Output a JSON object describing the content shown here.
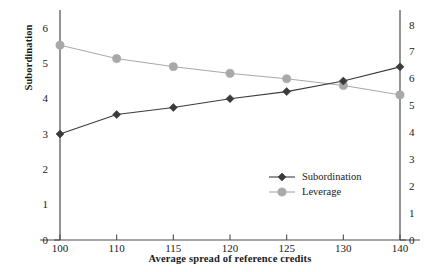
{
  "chart_data": {
    "type": "line",
    "title": "",
    "subtitle": "",
    "xlabel": "Average spread of reference credits",
    "ylabel": "Subordination",
    "y2label": "",
    "categories": [
      "100",
      "110",
      "115",
      "120",
      "125",
      "130",
      "140"
    ],
    "x_tick_labels": [
      "100",
      "110",
      "115",
      "120",
      "125",
      "130",
      "140"
    ],
    "y_tick_labels": [
      "0",
      "1",
      "2",
      "3",
      "4",
      "5",
      "6"
    ],
    "y2_tick_labels": [
      "0",
      "1",
      "2",
      "3",
      "4",
      "5",
      "6",
      "7",
      "8"
    ],
    "ylim": [
      0,
      6
    ],
    "y2lim": [
      0,
      8
    ],
    "grid": false,
    "legend_position": "center-right",
    "series": [
      {
        "name": "Subordination",
        "axis": "left",
        "marker": "diamond",
        "color": "#3b3b3b",
        "values": [
          3.0,
          3.55,
          3.75,
          4.0,
          4.2,
          4.5,
          4.9
        ]
      },
      {
        "name": "Leverage",
        "axis": "right",
        "marker": "circle",
        "color": "#a8a8a8",
        "values": [
          7.25,
          6.75,
          6.45,
          6.2,
          6.0,
          5.75,
          5.4
        ]
      }
    ]
  },
  "legend": {
    "items": [
      {
        "label": "Subordination"
      },
      {
        "label": "Leverage"
      }
    ]
  },
  "colors": {
    "subordination": "#3b3b3b",
    "leverage": "#a8a8a8",
    "axis": "#4d4d4d",
    "text": "#1a1a1a"
  }
}
